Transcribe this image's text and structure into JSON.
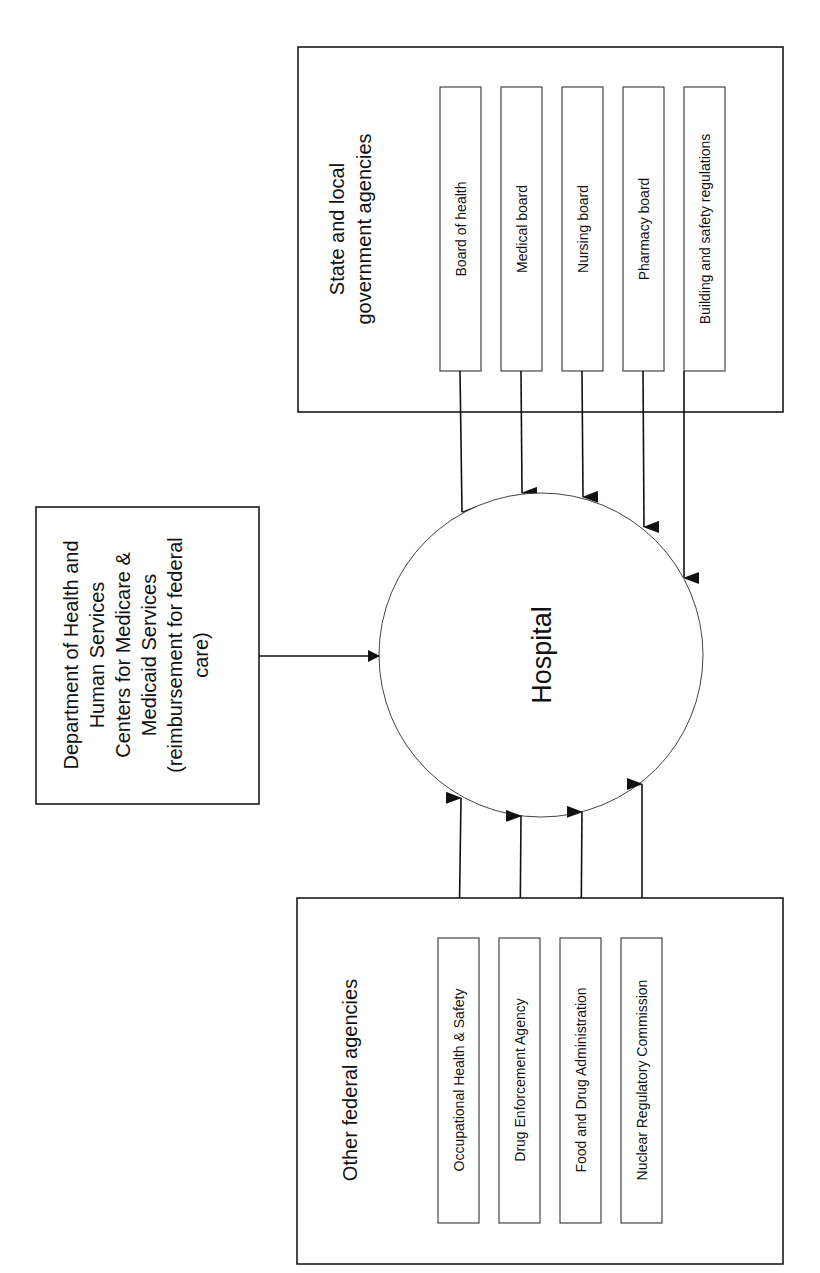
{
  "hub": {
    "label": "Hospital"
  },
  "state_local": {
    "title_lines": [
      "State and local",
      "government agencies"
    ],
    "items": [
      {
        "label": "Board of health"
      },
      {
        "label": "Medical board"
      },
      {
        "label": "Nursing board"
      },
      {
        "label": "Pharmacy board"
      },
      {
        "label": "Building and safety regulations"
      }
    ]
  },
  "dhhs": {
    "lines": [
      "Department of Health and",
      "Human Services",
      "Centers for Medicare &",
      "Medicaid Services",
      "(reimbursement for federal",
      "care)"
    ]
  },
  "other_federal": {
    "title": "Other federal agencies",
    "items": [
      {
        "label": "Occupational Health & Safety"
      },
      {
        "label": "Drug Enforcement Agency"
      },
      {
        "label": "Food and Drug Administration"
      },
      {
        "label": "Nuclear Regulatory Commission"
      }
    ]
  }
}
